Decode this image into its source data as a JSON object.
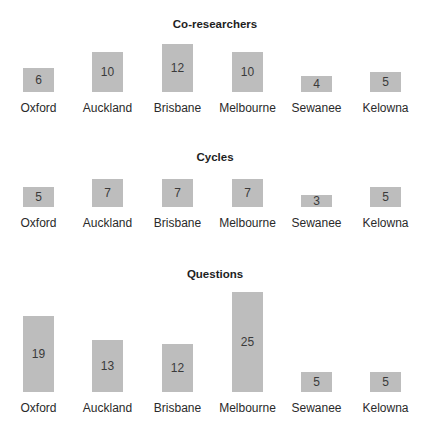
{
  "chart_data": [
    {
      "type": "bar",
      "title": "Co-researchers",
      "categories": [
        "Oxford",
        "Auckland",
        "Brisbane",
        "Melbourne",
        "Sewanee",
        "Kelowna"
      ],
      "values": [
        6,
        10,
        12,
        10,
        4,
        5
      ],
      "xlabel": "",
      "ylabel": "",
      "grid": false,
      "data_labels": true
    },
    {
      "type": "bar",
      "title": "Cycles",
      "categories": [
        "Oxford",
        "Auckland",
        "Brisbane",
        "Melbourne",
        "Sewanee",
        "Kelowna"
      ],
      "values": [
        5,
        7,
        7,
        7,
        3,
        5
      ],
      "xlabel": "",
      "ylabel": "",
      "grid": false,
      "data_labels": true
    },
    {
      "type": "bar",
      "title": "Questions",
      "categories": [
        "Oxford",
        "Auckland",
        "Brisbane",
        "Melbourne",
        "Sewanee",
        "Kelowna"
      ],
      "values": [
        19,
        13,
        12,
        25,
        5,
        5
      ],
      "xlabel": "",
      "ylabel": "",
      "grid": false,
      "data_labels": true
    }
  ],
  "colors": {
    "bar": "#bdbdbd",
    "text": "#222222"
  }
}
